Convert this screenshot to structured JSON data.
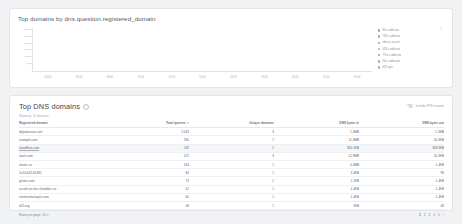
{
  "chart_panel": {
    "title": "Top domains by dns.question.registered_domain",
    "legend_overflow_icon": "more-vertical-icon"
  },
  "chart_data": {
    "type": "bar",
    "title": "Top domains by dns.question.registered_domain",
    "xlabel": "",
    "ylabel": "",
    "grid": false,
    "stacked": true,
    "legend_position": "right",
    "ylim": [
      0,
      30000
    ],
    "yticks": [
      "30,000",
      "25,000",
      "20,000",
      "15,000",
      "10,000",
      "5,000",
      "0"
    ],
    "categories": [
      "04:00",
      "06:00",
      "08:00",
      "10:00",
      "12:00",
      "14:00",
      "16:00",
      "18:00",
      "20:00",
      "22:00",
      "00:00"
    ],
    "series": [
      {
        "name": "80-t-addr.ovo",
        "color": "#9aa0a8",
        "values": [
          800,
          9000,
          9500,
          8500,
          3500,
          3500,
          3200,
          60,
          6000,
          6000,
          1400
        ]
      },
      {
        "name": "763-t-addr.ota",
        "color": "#a4aab1",
        "values": [
          700,
          8500,
          6500,
          7500,
          3200,
          3200,
          3000,
          40,
          5500,
          5500,
          1200
        ]
      },
      {
        "name": "wbcsv-sv.cert",
        "color": "#9fa5ad",
        "values": [
          600,
          4000,
          4200,
          4000,
          1600,
          1600,
          1500,
          30,
          3000,
          3000,
          900
        ]
      },
      {
        "name": "018-t-addr.ota",
        "color": "#a8aeb5",
        "values": [
          500,
          3000,
          3000,
          2800,
          1200,
          1200,
          1100,
          20,
          2200,
          2200,
          700
        ]
      },
      {
        "name": "77m-t-addr.ota",
        "color": "#9ca2aa",
        "values": [
          400,
          2500,
          2600,
          2400,
          1000,
          1000,
          900,
          15,
          1800,
          1800,
          600
        ]
      },
      {
        "name": "5lo-t-addr.ona",
        "color": "#a1a7af",
        "values": [
          300,
          2000,
          2100,
          1900,
          800,
          800,
          750,
          10,
          1500,
          1500,
          500
        ]
      },
      {
        "name": "d15.ops",
        "color": "#a6acb3",
        "values": [
          250,
          1600,
          1700,
          1500,
          700,
          700,
          650,
          8,
          1200,
          1200,
          400
        ]
      }
    ]
  },
  "table_panel": {
    "title": "Top DNS domains",
    "info_icon": "info-icon",
    "subtitle": "Showing: 10 domains",
    "ptr_toggle": {
      "label": "Include PTR records",
      "state": "off"
    },
    "columns": [
      "Registered domain",
      "Total queries",
      "Unique domains",
      "DNS bytes in",
      "DNS bytes out"
    ],
    "sorted_column_index": 1,
    "sort_caret": "▾",
    "rows": [
      {
        "domain": "digitalocean.com",
        "total_queries": "2,043",
        "unique_domains": "3",
        "bytes_in": "1.4MB",
        "bytes_out": "1.1MB",
        "selected": false
      },
      {
        "domain": "example.com",
        "total_queries": "280",
        "unique_domains": "1",
        "bytes_in": "11.4MB",
        "bytes_out": "44.4KB",
        "selected": false
      },
      {
        "domain": "cloudflare.com",
        "total_queries": "232",
        "unique_domains": "2",
        "bytes_in": "850.1KB",
        "bytes_out": "358.6KB",
        "selected": true
      },
      {
        "domain": "slack.com",
        "total_queries": "207",
        "unique_domains": "3",
        "bytes_in": "12.9MB",
        "bytes_out": "34.3KB",
        "selected": false
      },
      {
        "domain": "elastic.co",
        "total_queries": "164",
        "unique_domains": "1",
        "bytes_in": "4.4MB",
        "bytes_out": "1.4KB",
        "selected": false
      },
      {
        "domain": "1e10.b32.64.f82",
        "total_queries": "84",
        "unique_domains": "1",
        "bytes_in": "3.4KB",
        "bytes_out": "98",
        "selected": false
      },
      {
        "domain": "gstatic.com",
        "total_queries": "74",
        "unique_domains": "2",
        "bytes_in": "2.1KB",
        "bytes_out": "1.4KB",
        "selected": false
      },
      {
        "domain": "as-wifi-on-the-chandid.e.co",
        "total_queries": "67",
        "unique_domains": "1",
        "bytes_in": "4.4KB",
        "bytes_out": "1.4KB",
        "selected": false
      },
      {
        "domain": "contentstackapis.com",
        "total_queries": "60",
        "unique_domains": "1",
        "bytes_in": "1.4KB",
        "bytes_out": "1.4KB",
        "selected": false
      },
      {
        "domain": "d15.org",
        "total_queries": "48",
        "unique_domains": "1",
        "bytes_in": "1KB",
        "bytes_out": "48",
        "selected": false
      }
    ],
    "footer": {
      "rows_per_page_label": "Rows per page: 10",
      "rows_per_page_caret": "▾",
      "pages": [
        "1",
        "2",
        "3",
        "4",
        "5"
      ],
      "active_page": "1",
      "next_arrow": "›"
    }
  }
}
